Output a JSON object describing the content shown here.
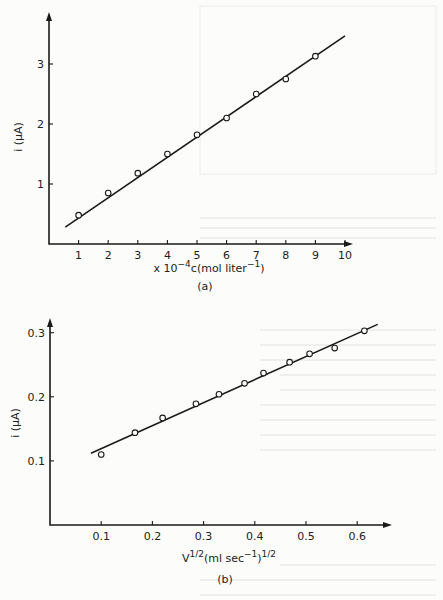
{
  "chart_data": [
    {
      "id": "a",
      "type": "scatter",
      "panel_label": "(a)",
      "title": "",
      "xlabel": "x 10^-4 c (mol liter^-1)",
      "xlabel_parts": {
        "prefix": "x 10",
        "exp": "−4",
        "main": "c(mol liter",
        "unit_exp": "−1",
        "close": ")"
      },
      "ylabel": "i (μA)",
      "xlim": [
        0,
        10.3
      ],
      "ylim": [
        0,
        3.85
      ],
      "xticks": [
        1,
        2,
        3,
        4,
        5,
        6,
        7,
        8,
        9,
        10
      ],
      "xtick_labels": [
        "1",
        "2",
        "3",
        "4",
        "5",
        "6",
        "7",
        "8",
        "9",
        "10"
      ],
      "yticks": [
        1,
        2,
        3
      ],
      "ytick_labels": [
        "1",
        "2",
        "3"
      ],
      "grid": false,
      "legend": null,
      "series": [
        {
          "name": "measured",
          "marker": "open-circle",
          "x": [
            1,
            2,
            3,
            4,
            5,
            6,
            7,
            8,
            9
          ],
          "y": [
            0.48,
            0.85,
            1.18,
            1.5,
            1.82,
            2.1,
            2.5,
            2.75,
            3.13
          ]
        },
        {
          "name": "linear fit",
          "style": "line",
          "x": [
            0.55,
            10.0
          ],
          "y": [
            0.28,
            3.47
          ]
        }
      ]
    },
    {
      "id": "b",
      "type": "scatter",
      "panel_label": "(b)",
      "title": "",
      "xlabel": "V^1/2 (ml sec^-1)^1/2",
      "xlabel_parts": {
        "prefix": "V",
        "exp": "1/2",
        "main": "(ml sec",
        "unit_exp": "−1",
        "close": ")",
        "close_exp": "1/2"
      },
      "ylabel": "i (μA)",
      "xlim": [
        0,
        0.66
      ],
      "ylim": [
        0,
        0.322
      ],
      "xticks": [
        0.1,
        0.2,
        0.3,
        0.4,
        0.5,
        0.6
      ],
      "xtick_labels": [
        "0.1",
        "0.2",
        "0.3",
        "0.4",
        "0.5",
        "0.6"
      ],
      "yticks": [
        0.1,
        0.2,
        0.3
      ],
      "ytick_labels": [
        "0.1",
        "0.2",
        "0.3"
      ],
      "grid": false,
      "legend": null,
      "series": [
        {
          "name": "measured",
          "marker": "open-circle",
          "x": [
            0.1,
            0.166,
            0.22,
            0.285,
            0.33,
            0.38,
            0.417,
            0.468,
            0.507,
            0.556,
            0.614
          ],
          "y": [
            0.11,
            0.144,
            0.167,
            0.189,
            0.204,
            0.221,
            0.237,
            0.254,
            0.267,
            0.276,
            0.303
          ]
        },
        {
          "name": "linear fit",
          "style": "line",
          "x": [
            0.08,
            0.64
          ],
          "y": [
            0.112,
            0.313
          ]
        }
      ]
    }
  ],
  "layout": {
    "panels": [
      {
        "origin": [
          49,
          244
        ],
        "x_px_per_unit": 29.6,
        "y_px_per_unit": 60,
        "x_axis_end": 353,
        "y_axis_top": 12,
        "xlabel_y": 272,
        "panel_label_y": 290,
        "ylabel_x": 22,
        "ylabel_y": 137
      },
      {
        "origin": [
          50,
          525
        ],
        "x_px_per_unit": 512,
        "y_px_per_unit": 641,
        "x_axis_end": 392,
        "y_axis_top": 318,
        "xlabel_y": 562,
        "panel_label_y": 583,
        "ylabel_x": 19,
        "ylabel_y": 423
      }
    ]
  }
}
